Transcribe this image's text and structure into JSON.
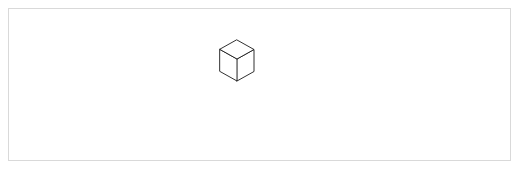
{
  "panel": {
    "background_color": "#ffffff",
    "frame_color": "#d9d9d9",
    "width": 521,
    "height": 171
  },
  "figure": {
    "title": "",
    "caption": "",
    "type": "isometric-cube-stack",
    "line_color": "#1a1a1a",
    "face_color": "#ffffff",
    "projection": "isometric",
    "cube_size_px": 34,
    "iso_dx": 17,
    "iso_dy": 9.5,
    "cube_height_px": 22,
    "origin_x": 237,
    "origin_y": 128,
    "footprint": "4x4",
    "total_cubes": 34,
    "heights_grid": [
      [
        4,
        4,
        3,
        3
      ],
      [
        3,
        3,
        3,
        2
      ],
      [
        2,
        2,
        2,
        2
      ],
      [
        1,
        2,
        1,
        1
      ]
    ]
  }
}
